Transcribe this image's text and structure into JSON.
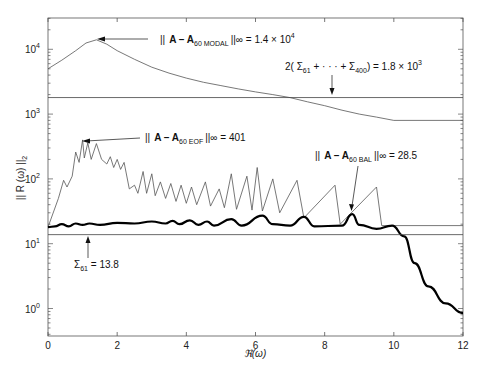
{
  "chart_data": {
    "type": "line",
    "title": "",
    "xlabel": "ℜ(ω)",
    "ylabel": "|| R (ω) ||₂",
    "xlim": [
      0,
      12
    ],
    "ylim_log10": [
      -0.45,
      3.7
    ],
    "yscale": "log",
    "grid": false,
    "x_ticks": [
      "0",
      "2",
      "4",
      "6",
      "8",
      "10",
      "12"
    ],
    "y_ticks": [
      {
        "base": "10",
        "exp": "4",
        "value": 10000
      },
      {
        "base": "10",
        "exp": "3",
        "value": 1000
      },
      {
        "base": "10",
        "exp": "2",
        "value": 100
      },
      {
        "base": "10",
        "exp": "1",
        "value": 10
      },
      {
        "base": "10",
        "exp": "0",
        "value": 1
      }
    ],
    "series": [
      {
        "name": "A - A60 MODAL",
        "style": "thin",
        "points": [
          [
            0,
            5000
          ],
          [
            0.4,
            6800
          ],
          [
            0.8,
            9500
          ],
          [
            1.1,
            12500
          ],
          [
            1.4,
            14000
          ],
          [
            1.7,
            12000
          ],
          [
            2.0,
            9500
          ],
          [
            2.5,
            7000
          ],
          [
            3.0,
            5300
          ],
          [
            3.5,
            4300
          ],
          [
            4.0,
            3600
          ],
          [
            4.5,
            3100
          ],
          [
            5.0,
            2750
          ],
          [
            5.5,
            2450
          ],
          [
            6.0,
            2200
          ],
          [
            6.5,
            2000
          ],
          [
            7.0,
            1800
          ],
          [
            7.5,
            1550
          ],
          [
            8.0,
            1350
          ],
          [
            8.5,
            1150
          ],
          [
            9.0,
            1000
          ],
          [
            9.5,
            900
          ],
          [
            10.0,
            800
          ],
          [
            12.0,
            800
          ]
        ]
      },
      {
        "name": "2(Σ₆₁ + … + Σ₄₀₀)",
        "style": "thin-horizontal",
        "value": 1800
      },
      {
        "name": "A - A60 EOF",
        "style": "thin",
        "points": [
          [
            0,
            18
          ],
          [
            0.3,
            50
          ],
          [
            0.45,
            95
          ],
          [
            0.55,
            75
          ],
          [
            0.7,
            110
          ],
          [
            0.8,
            260
          ],
          [
            0.9,
            180
          ],
          [
            1.0,
            400
          ],
          [
            1.05,
            210
          ],
          [
            1.15,
            360
          ],
          [
            1.25,
            200
          ],
          [
            1.4,
            350
          ],
          [
            1.55,
            200
          ],
          [
            1.7,
            170
          ],
          [
            1.8,
            220
          ],
          [
            1.9,
            150
          ],
          [
            2.0,
            200
          ],
          [
            2.1,
            140
          ],
          [
            2.2,
            180
          ],
          [
            2.35,
            70
          ],
          [
            2.5,
            80
          ],
          [
            2.6,
            60
          ],
          [
            2.75,
            130
          ],
          [
            2.85,
            60
          ],
          [
            3.0,
            120
          ],
          [
            3.1,
            55
          ],
          [
            3.25,
            90
          ],
          [
            3.4,
            50
          ],
          [
            3.55,
            85
          ],
          [
            3.7,
            45
          ],
          [
            3.85,
            80
          ],
          [
            4.0,
            42
          ],
          [
            4.15,
            75
          ],
          [
            4.3,
            40
          ],
          [
            4.55,
            90
          ],
          [
            4.7,
            38
          ],
          [
            4.95,
            70
          ],
          [
            5.1,
            36
          ],
          [
            5.3,
            120
          ],
          [
            5.45,
            34
          ],
          [
            5.75,
            110
          ],
          [
            5.9,
            33
          ],
          [
            6.05,
            150
          ],
          [
            6.2,
            32
          ],
          [
            6.5,
            100
          ],
          [
            6.7,
            30
          ],
          [
            7.2,
            95
          ],
          [
            7.4,
            25
          ],
          [
            8.3,
            80
          ],
          [
            8.45,
            20
          ],
          [
            9.5,
            75
          ],
          [
            9.65,
            19
          ],
          [
            12,
            19
          ]
        ]
      },
      {
        "name": "A - A60 BAL",
        "style": "thick",
        "points": [
          [
            0,
            18
          ],
          [
            0.2,
            18.5
          ],
          [
            0.4,
            20
          ],
          [
            0.6,
            18.5
          ],
          [
            0.8,
            20.5
          ],
          [
            1.0,
            19.5
          ],
          [
            1.2,
            20.5
          ],
          [
            1.5,
            19.5
          ],
          [
            2.0,
            21
          ],
          [
            2.5,
            20.5
          ],
          [
            3.0,
            22
          ],
          [
            3.4,
            20.5
          ],
          [
            3.6,
            22.5
          ],
          [
            3.8,
            20
          ],
          [
            4.1,
            23
          ],
          [
            4.35,
            19.5
          ],
          [
            4.6,
            22
          ],
          [
            4.8,
            19
          ],
          [
            5.3,
            24
          ],
          [
            5.6,
            19
          ],
          [
            6.2,
            27
          ],
          [
            6.5,
            20
          ],
          [
            7.0,
            19
          ],
          [
            7.4,
            26
          ],
          [
            7.7,
            18.5
          ],
          [
            8.5,
            19
          ],
          [
            8.8,
            28.5
          ],
          [
            9.0,
            19.5
          ],
          [
            9.5,
            17
          ],
          [
            9.95,
            19
          ],
          [
            10.3,
            13
          ],
          [
            10.6,
            5
          ],
          [
            11.0,
            2.2
          ],
          [
            11.5,
            1.2
          ],
          [
            12,
            0.85
          ]
        ]
      },
      {
        "name": "Σ₆₁",
        "style": "thin-horizontal",
        "value": 13.8
      }
    ],
    "annotations": [
      {
        "text_prefix": "|| ",
        "bold": "A – A",
        "sub": "60 MODAL",
        "suffix": " ||∞ = 1.4 × 10",
        "sup": "4",
        "arrow_to": [
          1.4,
          14000
        ]
      },
      {
        "text_prefix": "2( Σ",
        "sub": "61",
        "mid": " + · · · + Σ",
        "sub2": "400",
        "suffix": ") = 1.8 × 10",
        "sup": "3",
        "arrow_to": [
          8.7,
          1800
        ]
      },
      {
        "text_prefix": "|| ",
        "bold": "A – A",
        "sub": "60 EOF",
        "suffix": " ||∞ = 401",
        "arrow_to": [
          1.0,
          401
        ]
      },
      {
        "text_prefix": "|| ",
        "bold": "A – A",
        "sub": "60 BAL",
        "suffix": " ||∞ = 28.5",
        "arrow_to": [
          8.8,
          28.5
        ]
      },
      {
        "text_prefix": "Σ",
        "sub": "61",
        "suffix": " = 13.8",
        "arrow_to": [
          1.2,
          13.8
        ]
      }
    ]
  },
  "labels": {
    "xlabel": "ℜ(ω)",
    "ylabel_main": "|| R (ω) ||",
    "ylabel_sub": "2",
    "ann_modal_prefix": "||",
    "ann_modal_bold": "A – A",
    "ann_modal_sub": "60 MODAL",
    "ann_modal_suffix": "||∞ = 1.4 × 10",
    "ann_modal_sup": "4",
    "ann_sum_prefix": "2( Σ",
    "ann_sum_sub1": "61",
    "ann_sum_mid": " + · · · + Σ",
    "ann_sum_sub2": "400",
    "ann_sum_suffix": ") = 1.8 × 10",
    "ann_sum_sup": "3",
    "ann_eof_prefix": "||",
    "ann_eof_bold": "A – A",
    "ann_eof_sub": "60 EOF",
    "ann_eof_suffix": "||∞ = 401",
    "ann_bal_prefix": "||",
    "ann_bal_bold": "A – A",
    "ann_bal_sub": "60 BAL",
    "ann_bal_suffix": "||∞ = 28.5",
    "ann_sigma_prefix": "Σ",
    "ann_sigma_sub": "61",
    "ann_sigma_suffix": " = 13.8"
  }
}
